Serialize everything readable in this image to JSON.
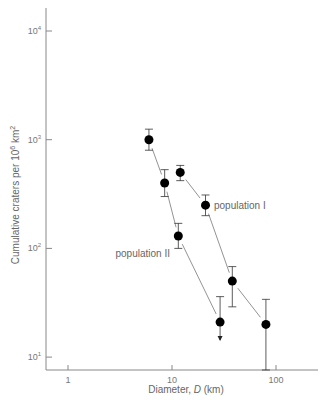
{
  "chart_data": {
    "type": "scatter",
    "title": "",
    "xlabel": "Diameter, D (km)",
    "ylabel": "Cumulative craters per 10^6 km^2",
    "xscale": "log",
    "yscale": "log",
    "xlim": [
      0.6,
      200
    ],
    "ylim": [
      7,
      15000
    ],
    "xticks": [
      {
        "value": 1,
        "label": "1"
      },
      {
        "value": 10,
        "label": "10"
      },
      {
        "value": 100,
        "label": "100"
      }
    ],
    "yticks": [
      {
        "value": 10000,
        "base": "10",
        "exp": "4"
      },
      {
        "value": 1000,
        "base": "10",
        "exp": "3"
      },
      {
        "value": 100,
        "base": "10",
        "exp": "2"
      },
      {
        "value": 10,
        "base": "10",
        "exp": "1"
      }
    ],
    "grid": false,
    "legend": "inline annotations",
    "series": [
      {
        "name": "population II",
        "label_pos": {
          "x": 9.5,
          "y": 95
        },
        "points": [
          {
            "x": 6,
            "y": 1000,
            "err_low": 800,
            "err_high": 1250
          },
          {
            "x": 8.5,
            "y": 400,
            "err_low": 300,
            "err_high": 530
          },
          {
            "x": 11.5,
            "y": 130,
            "err_low": 100,
            "err_high": 170
          },
          {
            "x": 29,
            "y": 21,
            "err_high": 36,
            "upper_limit": true
          }
        ]
      },
      {
        "name": "population I",
        "label_pos": {
          "x": 24,
          "y": 245
        },
        "points": [
          {
            "x": 12,
            "y": 500,
            "err_low": 420,
            "err_high": 580
          },
          {
            "x": 21,
            "y": 250,
            "err_low": 200,
            "err_high": 310
          },
          {
            "x": 38,
            "y": 50,
            "err_low": 29,
            "err_high": 68
          },
          {
            "x": 80,
            "y": 20,
            "err_low": 7,
            "err_high": 34
          }
        ]
      }
    ]
  },
  "labels": {
    "xlabel_main": "Diameter, ",
    "xlabel_var": "D",
    "xlabel_unit": " (km)",
    "ylabel_main": "Cumulative craters per 10",
    "ylabel_exp1": "6",
    "ylabel_unit": " km",
    "ylabel_exp2": "2"
  },
  "colors": {
    "axis": "#888888",
    "marker": "#000000",
    "line": "#777777",
    "text": "#666666"
  }
}
